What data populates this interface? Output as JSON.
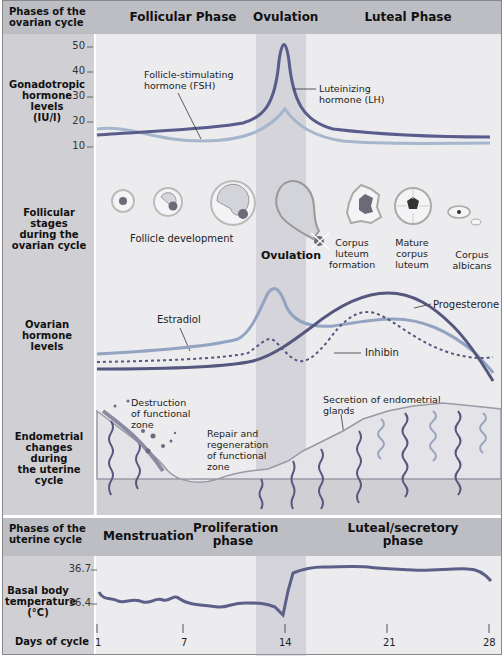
{
  "header_ovarian": {
    "row_label": "Phases of the ovarian cycle",
    "phases": [
      "Follicular Phase",
      "Ovulation",
      "Luteal Phase"
    ]
  },
  "gonadotropic": {
    "row_label": [
      "Gonadotropic",
      "hormone",
      "levels",
      "(IU/l)"
    ],
    "y_ticks": [
      "50",
      "40",
      "30",
      "20",
      "10"
    ],
    "fsh_label": [
      "Follicle-stimulating",
      "hormone (FSH)"
    ],
    "lh_label": [
      "Luteinizing",
      "hormone (LH)"
    ]
  },
  "follicular": {
    "row_label": [
      "Follicular stages",
      "during the",
      "ovarian cycle"
    ],
    "follicle_development": "Follicle development",
    "ovulation": "Ovulation",
    "corpus_luteum_formation": [
      "Corpus",
      "luteum",
      "formation"
    ],
    "mature_corpus_luteum": [
      "Mature",
      "corpus",
      "luteum"
    ],
    "corpus_albicans": [
      "Corpus",
      "albicans"
    ]
  },
  "ovarian_hormones": {
    "row_label": [
      "Ovarian",
      "hormone",
      "levels"
    ],
    "estradiol": "Estradiol",
    "progesterone": "Progesterone",
    "inhibin": "Inhibin"
  },
  "endometrial": {
    "row_label": [
      "Endometrial",
      "changes during",
      "the uterine",
      "cycle"
    ],
    "destruction": [
      "Destruction",
      "of functional",
      "zone"
    ],
    "repair": [
      "Repair and",
      "regeneration",
      "of functional",
      "zone"
    ],
    "secretion": [
      "Secretion of endometrial",
      "glands"
    ]
  },
  "header_uterine": {
    "row_label": [
      "Phases of the",
      "uterine cycle"
    ],
    "phases": [
      "Menstruation",
      "Proliferation phase",
      "Luteal/secretory phase"
    ]
  },
  "bbt": {
    "row_label": [
      "Basal body",
      "temperature",
      "(°C)"
    ],
    "y_ticks": [
      "36.7",
      "36.4"
    ]
  },
  "days": {
    "row_label": "Days of cycle",
    "ticks": [
      "1",
      "7",
      "14",
      "21",
      "28"
    ]
  },
  "colors": {
    "lh": "#5a5d8c",
    "fsh": "#9fb0c9",
    "estradiol": "#8f9fbf",
    "progesterone": "#55577f",
    "inhibin": "#55577f",
    "bbt": "#5c5f88",
    "header_bg": "#bdbdc4",
    "panel_bg": "#ececee"
  }
}
